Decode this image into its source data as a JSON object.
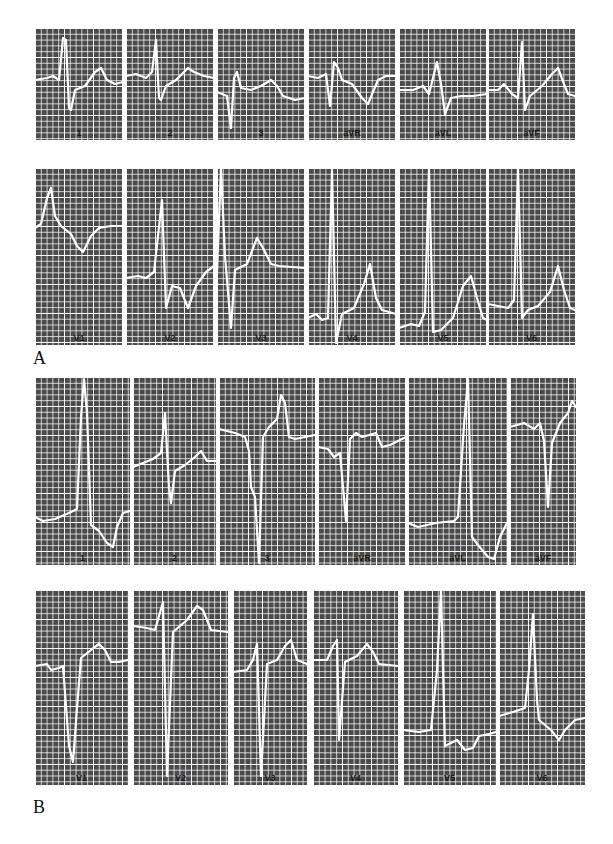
{
  "figure": {
    "panels": [
      {
        "label": "A",
        "limb_leads": [
          "1",
          "2",
          "3",
          "aVR",
          "aVL",
          "aVF"
        ],
        "precordial_leads": [
          "V1",
          "V2",
          "V3",
          "V4",
          "V5",
          "V6"
        ]
      },
      {
        "label": "B",
        "limb_leads": [
          "1",
          "2",
          "3",
          "aVR",
          "aVL",
          "aVF"
        ],
        "precordial_leads": [
          "V1",
          "V2",
          "V3",
          "V4",
          "V5",
          "V6"
        ]
      }
    ],
    "colors": {
      "grid_background": "#4a4a4a",
      "grid_lines": "#ffffff",
      "trace": "#ffffff",
      "label_text": "#1a1a1a"
    }
  }
}
